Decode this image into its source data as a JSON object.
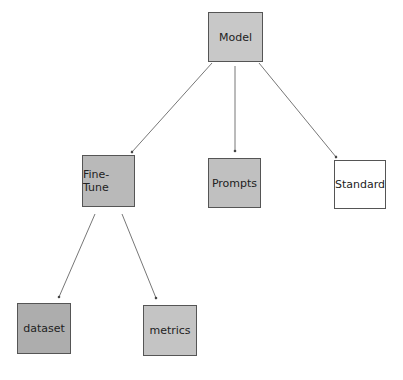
{
  "diagram": {
    "type": "tree",
    "nodes": [
      {
        "id": "model",
        "label": "Model",
        "fill": "#c8c8c8",
        "x": 208,
        "y": 12,
        "w": 55,
        "h": 50
      },
      {
        "id": "fine-tune",
        "label": "Fine-Tune",
        "fill": "#b9b9b9",
        "x": 82,
        "y": 155,
        "w": 53,
        "h": 52
      },
      {
        "id": "prompts",
        "label": "Prompts",
        "fill": "#c0c0c0",
        "x": 208,
        "y": 158,
        "w": 53,
        "h": 50
      },
      {
        "id": "standard",
        "label": "Standard",
        "fill": "#ffffff",
        "x": 334,
        "y": 160,
        "w": 52,
        "h": 49
      },
      {
        "id": "dataset",
        "label": "dataset",
        "fill": "#adadad",
        "x": 17,
        "y": 303,
        "w": 54,
        "h": 51
      },
      {
        "id": "metrics",
        "label": "metrics",
        "fill": "#c4c4c4",
        "x": 143,
        "y": 305,
        "w": 54,
        "h": 51
      }
    ],
    "edges": [
      {
        "from": "model",
        "to": "fine-tune"
      },
      {
        "from": "model",
        "to": "prompts"
      },
      {
        "from": "model",
        "to": "standard"
      },
      {
        "from": "fine-tune",
        "to": "dataset"
      },
      {
        "from": "fine-tune",
        "to": "metrics"
      }
    ]
  }
}
